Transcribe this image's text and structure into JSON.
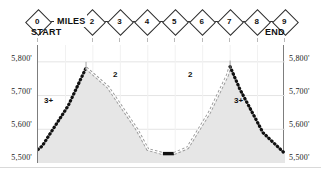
{
  "header": {
    "miles_word": "MILES",
    "start_label": "START",
    "end_label": "END",
    "markers": [
      {
        "label": "0",
        "mile": 0
      },
      {
        "label": "2",
        "mile": 2
      },
      {
        "label": "3",
        "mile": 3
      },
      {
        "label": "4",
        "mile": 4
      },
      {
        "label": "5",
        "mile": 5
      },
      {
        "label": "6",
        "mile": 6
      },
      {
        "label": "7",
        "mile": 7
      },
      {
        "label": "8",
        "mile": 8
      },
      {
        "label": "9",
        "mile": 9
      }
    ]
  },
  "axis": {
    "left_ticks": [
      "5,800'",
      "5,700'",
      "5,600'",
      "5,500'"
    ],
    "right_ticks": [
      "5,800'",
      "5,700'",
      "5,600'",
      "5,500'"
    ]
  },
  "annotations": {
    "grade_left_steep": "3+",
    "grade_left_moderate": "2",
    "grade_right_moderate": "2",
    "grade_right_steep": "3+"
  },
  "colors": {
    "fill": "#e6e6e6",
    "frame": "#7d7d7d",
    "grid": "#e4e4e4",
    "ink": "#1a1a1a",
    "marker_outline": "#2b2b2b"
  },
  "chart_data": {
    "type": "area",
    "title": "",
    "xlabel": "MILES",
    "ylabel": "",
    "xlim": [
      0,
      9
    ],
    "ylim": [
      5500,
      5850
    ],
    "yticks": [
      5500,
      5600,
      5700,
      5800
    ],
    "ytick_labels": [
      "5,500'",
      "5,600'",
      "5,700'",
      "5,800'"
    ],
    "xticks": [
      0,
      1,
      2,
      3,
      4,
      5,
      6,
      7,
      8,
      9
    ],
    "grid": true,
    "legend": "none",
    "series": [
      {
        "name": "Elevation profile",
        "x": [
          0.0,
          0.15,
          1.1,
          1.75,
          2.55,
          3.6,
          4.0,
          4.55,
          4.95,
          5.45,
          6.25,
          6.9,
          7.0,
          7.35,
          8.2,
          9.0
        ],
        "values": [
          5540,
          5550,
          5670,
          5782,
          5725,
          5600,
          5540,
          5528,
          5528,
          5545,
          5650,
          5760,
          5786,
          5720,
          5590,
          5528
        ]
      }
    ],
    "segments": [
      {
        "from_mile": 0.0,
        "to_mile": 1.75,
        "grade": "3+",
        "style": "steep-ascent"
      },
      {
        "from_mile": 1.75,
        "to_mile": 4.55,
        "grade": "2",
        "style": "moderate-descent"
      },
      {
        "from_mile": 4.55,
        "to_mile": 4.95,
        "grade": "0",
        "style": "flat-valley"
      },
      {
        "from_mile": 4.95,
        "to_mile": 7.0,
        "grade": "2",
        "style": "moderate-ascent"
      },
      {
        "from_mile": 7.0,
        "to_mile": 9.0,
        "grade": "3+",
        "style": "steep-descent"
      }
    ],
    "peaks": [
      {
        "mile": 1.75,
        "elevation": 5782
      },
      {
        "mile": 7.0,
        "elevation": 5786
      }
    ],
    "valley": {
      "from_mile": 4.55,
      "to_mile": 4.95,
      "elevation": 5528
    }
  }
}
